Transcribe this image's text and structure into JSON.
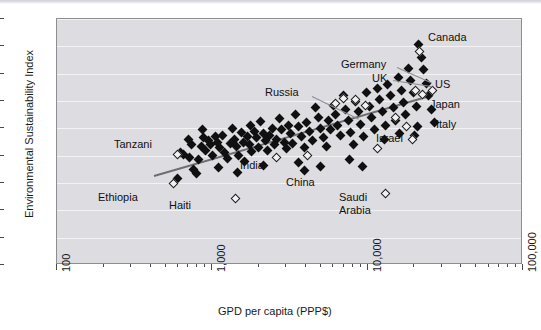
{
  "chart_data": {
    "type": "scatter",
    "title": "",
    "xlabel": "GPD per capita (PPP$)",
    "ylabel": "Environmental Sustainability Index",
    "xscale": "log",
    "xlim": [
      100,
      100000
    ],
    "ylim": [
      0,
      90
    ],
    "grid": true,
    "legend": "none",
    "xticks": [
      {
        "value": 100,
        "label": "100",
        "major": true
      },
      {
        "value": 1000,
        "label": "1,000",
        "major": true
      },
      {
        "value": 10000,
        "label": "10,000",
        "major": true
      },
      {
        "value": 100000,
        "label": "100,000",
        "major": true
      }
    ],
    "yticks": [
      {
        "value": 0,
        "label": "0"
      },
      {
        "value": 10,
        "label": "10"
      },
      {
        "value": 20,
        "label": "20"
      },
      {
        "value": 30,
        "label": "30"
      },
      {
        "value": 40,
        "label": "40"
      },
      {
        "value": 50,
        "label": "50"
      },
      {
        "value": 60,
        "label": "60"
      },
      {
        "value": 70,
        "label": "70"
      },
      {
        "value": 80,
        "label": "80"
      },
      {
        "value": 90,
        "label": "90"
      }
    ],
    "trendline": {
      "x0": 420,
      "y0": 33.0,
      "x1": 26000,
      "y1": 62.5,
      "color": "#6d6d73"
    },
    "annotations": [
      {
        "text": "Tanzani",
        "x": 113,
        "y": 137,
        "leader": null
      },
      {
        "text": "Ethiopia",
        "x": 97,
        "y": 190,
        "leader": null
      },
      {
        "text": "Haiti",
        "x": 168,
        "y": 198,
        "leader": null
      },
      {
        "text": "India",
        "x": 239,
        "y": 158,
        "leader": null
      },
      {
        "text": "China",
        "x": 285,
        "y": 175,
        "leader": null
      },
      {
        "text": "Russia",
        "x": 264,
        "y": 85,
        "leader": {
          "x": 311,
          "y": 95,
          "len": 52,
          "angle": 26
        }
      },
      {
        "text": "Germany",
        "x": 340,
        "y": 57,
        "leader": {
          "x": 396,
          "y": 66,
          "len": 38,
          "angle": 24
        }
      },
      {
        "text": "UK",
        "x": 371,
        "y": 71,
        "leader": {
          "x": 392,
          "y": 79,
          "len": 40,
          "angle": 9
        }
      },
      {
        "text": "Canada",
        "x": 427,
        "y": 30,
        "leader": null
      },
      {
        "text": "US",
        "x": 434,
        "y": 77,
        "leader": null
      },
      {
        "text": "Japan",
        "x": 429,
        "y": 97,
        "leader": null
      },
      {
        "text": "Italy",
        "x": 435,
        "y": 117,
        "leader": null
      },
      {
        "text": "Israel",
        "x": 375,
        "y": 131,
        "leader": null
      },
      {
        "text": "Saudi",
        "x": 338,
        "y": 190,
        "leader": null
      },
      {
        "text": "Arabia",
        "x": 338,
        "y": 203,
        "leader": null
      }
    ],
    "points_filled": [
      [
        600,
        31.5
      ],
      [
        620,
        41.0
      ],
      [
        650,
        40.5
      ],
      [
        700,
        46.0
      ],
      [
        715,
        39.5
      ],
      [
        730,
        44.0
      ],
      [
        760,
        35.0
      ],
      [
        790,
        33.5
      ],
      [
        820,
        38.5
      ],
      [
        850,
        43.5
      ],
      [
        880,
        46.5
      ],
      [
        905,
        42.0
      ],
      [
        940,
        45.5
      ],
      [
        980,
        44.0
      ],
      [
        1000,
        40.0
      ],
      [
        1050,
        47.0
      ],
      [
        1080,
        45.0
      ],
      [
        1120,
        43.0
      ],
      [
        1160,
        47.5
      ],
      [
        1200,
        41.0
      ],
      [
        1250,
        39.0
      ],
      [
        1300,
        44.5
      ],
      [
        1340,
        50.0
      ],
      [
        1390,
        46.0
      ],
      [
        1430,
        43.5
      ],
      [
        1480,
        40.0
      ],
      [
        1530,
        48.5
      ],
      [
        1580,
        45.0
      ],
      [
        1620,
        38.0
      ],
      [
        1680,
        47.0
      ],
      [
        1740,
        44.0
      ],
      [
        1800,
        41.5
      ],
      [
        1860,
        49.0
      ],
      [
        1920,
        46.5
      ],
      [
        1980,
        43.0
      ],
      [
        2050,
        52.5
      ],
      [
        2120,
        48.0
      ],
      [
        2200,
        45.5
      ],
      [
        2270,
        42.0
      ],
      [
        2350,
        47.5
      ],
      [
        2430,
        50.0
      ],
      [
        2520,
        44.0
      ],
      [
        2600,
        46.0
      ],
      [
        2700,
        53.5
      ],
      [
        2800,
        49.5
      ],
      [
        2900,
        45.0
      ],
      [
        3000,
        42.5
      ],
      [
        3100,
        51.0
      ],
      [
        3200,
        48.0
      ],
      [
        3300,
        44.5
      ],
      [
        3450,
        55.0
      ],
      [
        3600,
        50.5
      ],
      [
        3750,
        47.0
      ],
      [
        3900,
        43.0
      ],
      [
        4050,
        52.0
      ],
      [
        4200,
        49.0
      ],
      [
        4400,
        45.5
      ],
      [
        4600,
        57.5
      ],
      [
        4800,
        54.0
      ],
      [
        5000,
        50.0
      ],
      [
        5200,
        46.5
      ],
      [
        5400,
        43.5
      ],
      [
        5600,
        53.0
      ],
      [
        5800,
        49.5
      ],
      [
        6000,
        58.5
      ],
      [
        6200,
        55.0
      ],
      [
        6400,
        51.0
      ],
      [
        6700,
        47.5
      ],
      [
        7000,
        62.0
      ],
      [
        7200,
        57.0
      ],
      [
        7500,
        53.0
      ],
      [
        7800,
        48.5
      ],
      [
        8100,
        44.0
      ],
      [
        8400,
        60.0
      ],
      [
        8700,
        56.0
      ],
      [
        9000,
        51.5
      ],
      [
        9400,
        47.0
      ],
      [
        9800,
        63.0
      ],
      [
        10200,
        58.0
      ],
      [
        10600,
        54.0
      ],
      [
        11000,
        49.5
      ],
      [
        11500,
        64.5
      ],
      [
        12000,
        60.5
      ],
      [
        12500,
        56.0
      ],
      [
        13000,
        51.0
      ],
      [
        13500,
        66.0
      ],
      [
        14000,
        62.0
      ],
      [
        14600,
        57.5
      ],
      [
        15200,
        53.0
      ],
      [
        15800,
        68.5
      ],
      [
        16400,
        64.0
      ],
      [
        17000,
        59.5
      ],
      [
        17600,
        55.0
      ],
      [
        18300,
        72.0
      ],
      [
        19000,
        67.5
      ],
      [
        19800,
        63.0
      ],
      [
        20500,
        58.0
      ],
      [
        21300,
        80.5
      ],
      [
        22100,
        76.0
      ],
      [
        23000,
        71.5
      ],
      [
        23900,
        66.5
      ],
      [
        24800,
        62.0
      ],
      [
        25800,
        57.0
      ],
      [
        26800,
        52.0
      ],
      [
        21000,
        50.5
      ],
      [
        20000,
        47.5
      ],
      [
        9200,
        36.0
      ],
      [
        7600,
        38.5
      ],
      [
        2150,
        36.5
      ],
      [
        1100,
        35.5
      ],
      [
        1450,
        34.0
      ],
      [
        3600,
        37.5
      ],
      [
        5000,
        36.0
      ],
      [
        3900,
        34.5
      ],
      [
        12800,
        46.0
      ],
      [
        16000,
        48.0
      ],
      [
        870,
        49.5
      ],
      [
        1750,
        51.0
      ]
    ],
    "points_open": [
      [
        560,
        30.0
      ],
      [
        600,
        40.5
      ],
      [
        1400,
        24.5
      ],
      [
        2600,
        39.5
      ],
      [
        4100,
        40.0
      ],
      [
        9700,
        58.5
      ],
      [
        13000,
        26.0
      ],
      [
        15000,
        54.0
      ],
      [
        17800,
        50.5
      ],
      [
        19500,
        46.0
      ],
      [
        20200,
        64.0
      ],
      [
        21500,
        78.0
      ],
      [
        22500,
        62.5
      ],
      [
        26000,
        64.0
      ],
      [
        7000,
        61.0
      ],
      [
        8300,
        60.5
      ],
      [
        11500,
        42.5
      ],
      [
        6200,
        59.0
      ]
    ]
  }
}
